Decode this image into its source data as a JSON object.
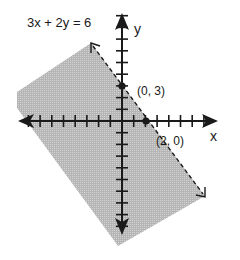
{
  "equation_label": "3x + 2y = 6",
  "axes": {
    "x_label": "x",
    "y_label": "y",
    "origin_px": [
      122,
      121
    ],
    "unit_px": 11.7,
    "x_ticks": [
      -8,
      -7,
      -6,
      -5,
      -4,
      -3,
      -2,
      -1,
      1,
      2,
      3,
      4,
      5,
      6,
      7
    ],
    "y_ticks": [
      9,
      8,
      7,
      6,
      5,
      4,
      3,
      2,
      1,
      -1,
      -2,
      -3,
      -4,
      -5,
      -6,
      -7,
      -8,
      -9
    ]
  },
  "points": [
    {
      "label": "(0, 3)",
      "x": 0,
      "y": 3
    },
    {
      "label": "(2, 0)",
      "x": 2,
      "y": 0
    }
  ],
  "boundary_line": {
    "style": "dashed",
    "equation": "3x + 2y = 6"
  },
  "shaded_region": {
    "description": "half-plane below/left of line",
    "color": "#b8b8b8"
  },
  "colors": {
    "axis": "#1a1a1a",
    "shade": "#b5b5b5",
    "shade_dot": "#d2d2d2",
    "background": "#ffffff"
  },
  "chart_data": {
    "type": "inequality-graph",
    "title": "3x + 2y = 6",
    "xlabel": "x",
    "ylabel": "y",
    "line": {
      "slope": -1.5,
      "intercept": 3,
      "dashed": true
    },
    "labeled_points": [
      [
        0,
        3
      ],
      [
        2,
        0
      ]
    ],
    "shaded": "side containing origin",
    "grid": false
  }
}
